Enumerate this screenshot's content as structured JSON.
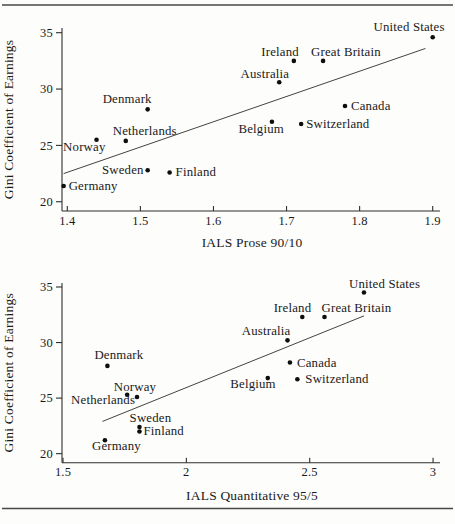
{
  "figure": {
    "background": "#fdfdfb",
    "ink_color": "#1a1a1a",
    "rule_color": "#474747",
    "marker_color": "#0e0e0e"
  },
  "chart_data": [
    {
      "type": "scatter",
      "title": "",
      "xlabel": "IALS Prose 90/10",
      "ylabel": "Gini Coefficient of Earnings",
      "xlim": [
        1.4,
        1.9
      ],
      "ylim": [
        20,
        35
      ],
      "grid": false,
      "legend": "none",
      "xticks": [
        {
          "v": 1.4,
          "t": "1.4"
        },
        {
          "v": 1.5,
          "t": "1.5"
        },
        {
          "v": 1.6,
          "t": "1.6"
        },
        {
          "v": 1.7,
          "t": "1.7"
        },
        {
          "v": 1.8,
          "t": "1.8"
        },
        {
          "v": 1.9,
          "t": "1.9"
        }
      ],
      "yticks": [
        {
          "v": 20,
          "t": "20"
        },
        {
          "v": 25,
          "t": "25"
        },
        {
          "v": 30,
          "t": "30"
        },
        {
          "v": 35,
          "t": "35"
        }
      ],
      "trendline": {
        "x1": 1.395,
        "y1": 22.5,
        "x2": 1.89,
        "y2": 33.6
      },
      "points": [
        {
          "country": "Germany",
          "x": 1.395,
          "y": 21.4,
          "anchor": "start",
          "dx": 5,
          "dy": 4
        },
        {
          "country": "Norway",
          "x": 1.44,
          "y": 25.5,
          "anchor": "end",
          "dx": 9,
          "dy": 11
        },
        {
          "country": "Netherlands",
          "x": 1.48,
          "y": 25.4,
          "anchor": "start",
          "dx": -13,
          "dy": -6
        },
        {
          "country": "Sweden",
          "x": 1.51,
          "y": 22.8,
          "anchor": "end",
          "dx": -4,
          "dy": 4
        },
        {
          "country": "Denmark",
          "x": 1.51,
          "y": 28.2,
          "anchor": "end",
          "dx": 4,
          "dy": -6
        },
        {
          "country": "Finland",
          "x": 1.54,
          "y": 22.6,
          "anchor": "start",
          "dx": 6,
          "dy": 4
        },
        {
          "country": "Belgium",
          "x": 1.68,
          "y": 27.1,
          "anchor": "end",
          "dx": 12,
          "dy": 11
        },
        {
          "country": "Australia",
          "x": 1.69,
          "y": 30.6,
          "anchor": "end",
          "dx": 10,
          "dy": -4
        },
        {
          "country": "Ireland",
          "x": 1.71,
          "y": 32.5,
          "anchor": "end",
          "dx": 5,
          "dy": -5
        },
        {
          "country": "Switzerland",
          "x": 1.72,
          "y": 26.9,
          "anchor": "start",
          "dx": 5,
          "dy": 4
        },
        {
          "country": "Great Britain",
          "x": 1.75,
          "y": 32.5,
          "anchor": "start",
          "dx": -12,
          "dy": -5
        },
        {
          "country": "Canada",
          "x": 1.78,
          "y": 28.5,
          "anchor": "start",
          "dx": 6,
          "dy": 4
        },
        {
          "country": "United States",
          "x": 1.9,
          "y": 34.6,
          "anchor": "end",
          "dx": 12,
          "dy": -6
        }
      ]
    },
    {
      "type": "scatter",
      "title": "",
      "xlabel": "IALS Quantitative 95/5",
      "ylabel": "Gini Coefficient of Earnings",
      "xlim": [
        1.5,
        3.0
      ],
      "ylim": [
        20,
        35
      ],
      "grid": false,
      "legend": "none",
      "xticks": [
        {
          "v": 1.5,
          "t": "1.5"
        },
        {
          "v": 2,
          "t": "2"
        },
        {
          "v": 2.5,
          "t": "2.5"
        },
        {
          "v": 3,
          "t": "3"
        }
      ],
      "yticks": [
        {
          "v": 20,
          "t": "20"
        },
        {
          "v": 25,
          "t": "25"
        },
        {
          "v": 30,
          "t": "30"
        },
        {
          "v": 35,
          "t": "35"
        }
      ],
      "trendline": {
        "x1": 1.66,
        "y1": 22.9,
        "x2": 2.72,
        "y2": 32.4
      },
      "points": [
        {
          "country": "Germany",
          "x": 1.67,
          "y": 21.2,
          "anchor": "start",
          "dx": -13,
          "dy": 10
        },
        {
          "country": "Denmark",
          "x": 1.68,
          "y": 27.9,
          "anchor": "start",
          "dx": -13,
          "dy": -7
        },
        {
          "country": "Netherlands",
          "x": 1.76,
          "y": 25.3,
          "anchor": "end",
          "dx": 8,
          "dy": 9
        },
        {
          "country": "Norway",
          "x": 1.8,
          "y": 25.1,
          "anchor": "middle",
          "dx": -2,
          "dy": -6
        },
        {
          "country": "Sweden",
          "x": 1.81,
          "y": 22.4,
          "anchor": "middle",
          "dx": 11,
          "dy": -5
        },
        {
          "country": "Finland",
          "x": 1.81,
          "y": 22.0,
          "anchor": "start",
          "dx": 4,
          "dy": 4
        },
        {
          "country": "Belgium",
          "x": 2.33,
          "y": 26.8,
          "anchor": "end",
          "dx": 8,
          "dy": 10
        },
        {
          "country": "Australia",
          "x": 2.41,
          "y": 30.2,
          "anchor": "end",
          "dx": 3,
          "dy": -5
        },
        {
          "country": "Canada",
          "x": 2.42,
          "y": 28.2,
          "anchor": "start",
          "dx": 7,
          "dy": 4
        },
        {
          "country": "Switzerland",
          "x": 2.45,
          "y": 26.7,
          "anchor": "start",
          "dx": 8,
          "dy": 4
        },
        {
          "country": "Ireland",
          "x": 2.47,
          "y": 32.3,
          "anchor": "end",
          "dx": 9,
          "dy": -5
        },
        {
          "country": "Great Britain",
          "x": 2.56,
          "y": 32.3,
          "anchor": "start",
          "dx": -3,
          "dy": -5
        },
        {
          "country": "United States",
          "x": 2.72,
          "y": 34.5,
          "anchor": "start",
          "dx": -15,
          "dy": -5
        }
      ]
    }
  ]
}
